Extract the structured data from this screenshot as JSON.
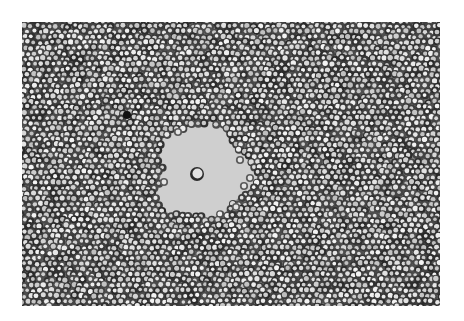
{
  "image": {
    "kind": "brightfield-micrograph",
    "width": 464,
    "height": 321,
    "background": "#ffffff",
    "frame": {
      "x": 22,
      "y": 22,
      "w": 418,
      "h": 284
    },
    "field": {
      "base_gray": "#8a8a8a",
      "cell_fill": "#dcdcdc",
      "cell_rim": "#3c3c3c",
      "cell_radius": 3.2,
      "spacing": 6.2
    },
    "clear_zone": {
      "cx": 202,
      "cy": 172,
      "r": 52,
      "fill": "#cfcfcf"
    },
    "central_cell": {
      "cx": 197,
      "cy": 174,
      "r": 7,
      "fill": "#e2e2e2",
      "rim": "#2a2a2a"
    },
    "dark_spot": {
      "cx": 127,
      "cy": 115,
      "r": 4,
      "fill": "#111111"
    }
  }
}
